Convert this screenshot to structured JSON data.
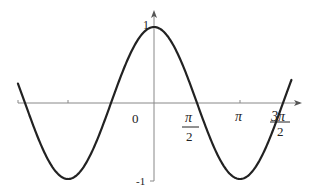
{
  "chart_data": {
    "type": "line",
    "title": "",
    "function": "y = cos(x)",
    "xlabel": "",
    "ylabel": "",
    "x_tick_labels": [
      "0",
      "π/2",
      "π",
      "3π/2"
    ],
    "y_tick_labels": [
      "1",
      "-1"
    ],
    "origin_label": "0",
    "xlim_radians": [
      -4.97,
      5.02
    ],
    "ylim": [
      -1,
      1
    ],
    "series": [
      {
        "name": "cos(x)",
        "x": [
          -4.97,
          -3.1416,
          -1.5708,
          0,
          1.5708,
          3.1416,
          4.7124,
          5.02
        ],
        "values": [
          0.25,
          -1,
          0,
          1,
          0,
          -1,
          0,
          0.3
        ]
      }
    ],
    "grid": false,
    "legend": "none",
    "color": "#222222"
  },
  "labels": {
    "y_top": "1",
    "y_bottom": "-1",
    "origin": "0",
    "pi": "π",
    "half_pi_num": "π",
    "half_pi_den": "2",
    "three_half_pi_num": "3π",
    "three_half_pi_den": "2"
  }
}
